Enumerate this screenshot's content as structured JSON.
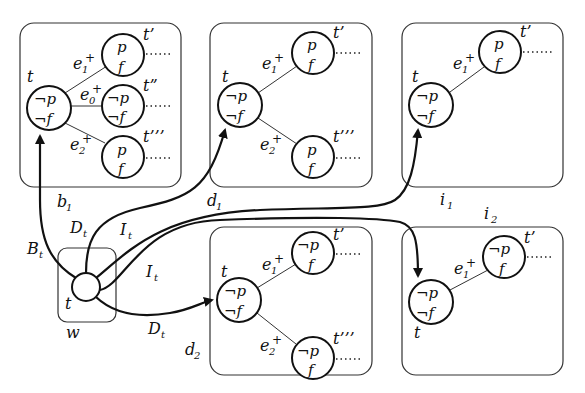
{
  "diagram": {
    "world": {
      "label": "w",
      "node_label": "t"
    },
    "boxes": [
      {
        "id": "b1",
        "label": "b",
        "sub": "1"
      },
      {
        "id": "d1",
        "label": "d",
        "sub": "1"
      },
      {
        "id": "i1",
        "label": "i",
        "sub": "1"
      },
      {
        "id": "d2",
        "label": "d",
        "sub": "2"
      },
      {
        "id": "i2",
        "label": "i",
        "sub": "2"
      }
    ],
    "arrows": [
      {
        "label": "B",
        "sub": "t",
        "to": "b1"
      },
      {
        "label": "D",
        "sub": "t",
        "to": "d1"
      },
      {
        "label": "I",
        "sub": "t",
        "to": "i1"
      },
      {
        "label": "I",
        "sub": "t",
        "to": "i2"
      },
      {
        "label": "D",
        "sub": "t",
        "to": "d2"
      }
    ],
    "node_texts": {
      "neg_p": "¬p",
      "neg_f": "¬f",
      "p": "p",
      "f": "f"
    },
    "state_labels": {
      "t": "t",
      "t1": "t’",
      "t2": "t”",
      "t3": "t’’’"
    },
    "edge_labels": {
      "e": "e",
      "plus": "+",
      "e1_sub": "1",
      "e0_sub": "0",
      "e2_sub": "2"
    }
  }
}
